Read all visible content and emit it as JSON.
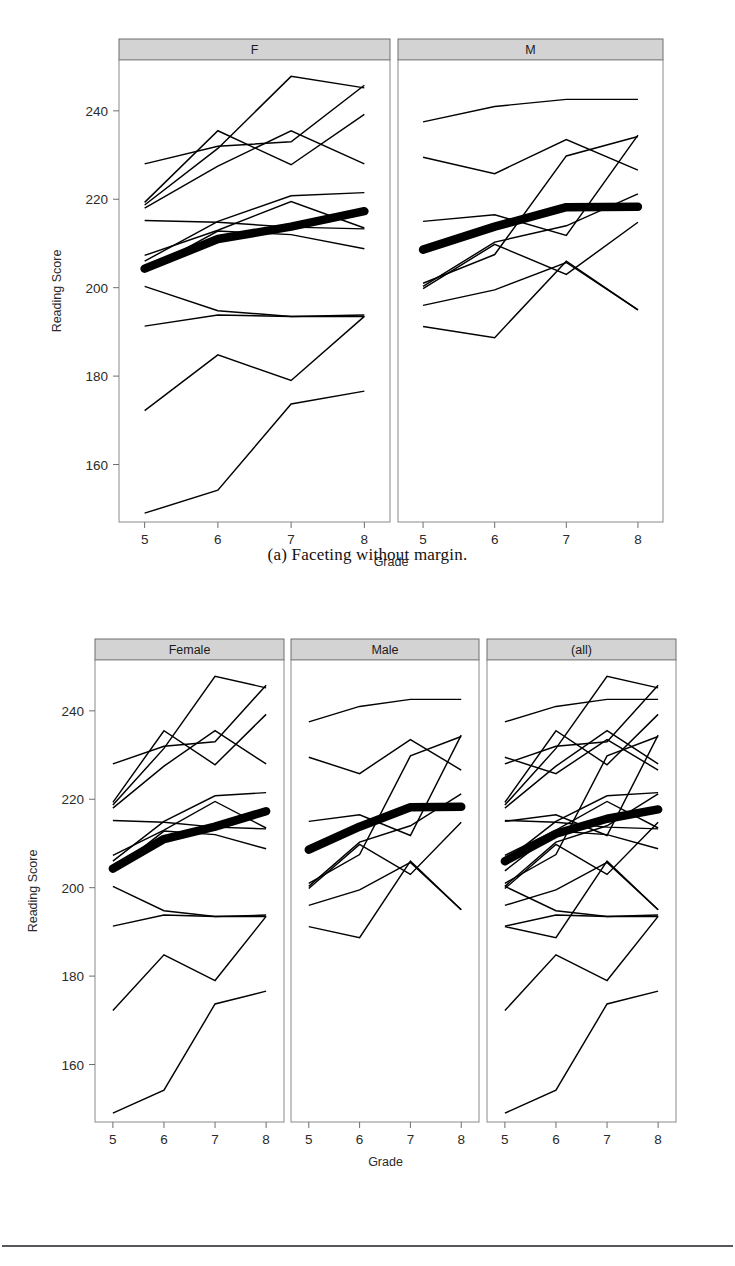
{
  "figure_a": {
    "caption": "(a) Faceting without margin.",
    "panels": [
      {
        "id": "panel-f",
        "label": "F"
      },
      {
        "id": "panel-m",
        "label": "M"
      }
    ]
  },
  "figure_b": {
    "caption": "(b) Faceting with margin.",
    "panels": [
      {
        "id": "panel-female",
        "label": "Female"
      },
      {
        "id": "panel-male",
        "label": "Male"
      },
      {
        "id": "panel-all",
        "label": "(all)"
      }
    ]
  },
  "chart_data": [
    {
      "id": "chart-a",
      "type": "line",
      "title": "",
      "xlabel": "Grade",
      "ylabel": "Reading Score",
      "x": [
        5,
        6,
        7,
        8
      ],
      "xticklabels": [
        "5",
        "6",
        "7",
        "8"
      ],
      "yticks": [
        160,
        180,
        200,
        220,
        240
      ],
      "yticklabels": [
        "160",
        "180",
        "200",
        "220",
        "240"
      ],
      "xlim": [
        4.65,
        8.35
      ],
      "ylim": [
        147.0,
        251.5
      ],
      "grid": false,
      "legend": "none",
      "facets": [
        {
          "label": "F",
          "series": [
            {
              "name": "F01",
              "values": [
                228.0,
                232.0,
                233.0,
                245.8
              ],
              "emphasis": false
            },
            {
              "name": "F02",
              "values": [
                218.7,
                231.5,
                247.8,
                245.2
              ],
              "emphasis": false
            },
            {
              "name": "F03",
              "values": [
                218.0,
                227.5,
                235.5,
                228.0
              ],
              "emphasis": false
            },
            {
              "name": "F04",
              "values": [
                219.3,
                235.5,
                227.8,
                239.2
              ],
              "emphasis": false
            },
            {
              "name": "F05",
              "values": [
                215.2,
                214.8,
                213.7,
                213.3
              ],
              "emphasis": false
            },
            {
              "name": "F06",
              "values": [
                206.0,
                215.0,
                220.8,
                221.5
              ],
              "emphasis": false
            },
            {
              "name": "F07",
              "values": [
                207.3,
                213.0,
                219.5,
                213.5
              ],
              "emphasis": false
            },
            {
              "name": "F08",
              "values": [
                203.8,
                212.8,
                212.0,
                208.8
              ],
              "emphasis": false
            },
            {
              "name": "F09",
              "values": [
                200.3,
                194.8,
                193.5,
                193.5
              ],
              "emphasis": false
            },
            {
              "name": "F10",
              "values": [
                191.3,
                193.8,
                193.5,
                193.8
              ],
              "emphasis": false
            },
            {
              "name": "F11",
              "values": [
                172.2,
                184.8,
                179.0,
                193.5
              ],
              "emphasis": false
            },
            {
              "name": "F12",
              "values": [
                149.0,
                154.2,
                173.7,
                176.6
              ],
              "emphasis": false
            },
            {
              "name": "F-mean",
              "values": [
                204.3,
                211.0,
                213.8,
                217.3
              ],
              "emphasis": true
            }
          ]
        },
        {
          "label": "M",
          "series": [
            {
              "name": "M01",
              "values": [
                237.5,
                241.0,
                242.6,
                242.6
              ],
              "emphasis": false
            },
            {
              "name": "M02",
              "values": [
                229.5,
                225.8,
                233.5,
                226.6
              ],
              "emphasis": false
            },
            {
              "name": "M03",
              "values": [
                215.0,
                216.5,
                211.8,
                234.5
              ],
              "emphasis": false
            },
            {
              "name": "M04",
              "values": [
                201.0,
                207.5,
                229.8,
                234.2
              ],
              "emphasis": false
            },
            {
              "name": "M05",
              "values": [
                200.3,
                210.3,
                214.0,
                221.2
              ],
              "emphasis": false
            },
            {
              "name": "M06",
              "values": [
                199.8,
                209.8,
                203.0,
                214.8
              ],
              "emphasis": false
            },
            {
              "name": "M07",
              "values": [
                196.0,
                199.5,
                205.7,
                195.0
              ],
              "emphasis": false
            },
            {
              "name": "M08",
              "values": [
                191.2,
                188.7,
                206.0,
                195.0
              ],
              "emphasis": false
            },
            {
              "name": "M-mean",
              "values": [
                208.6,
                213.8,
                218.2,
                218.3
              ],
              "emphasis": true
            }
          ]
        }
      ]
    },
    {
      "id": "chart-b",
      "type": "line",
      "title": "",
      "xlabel": "Grade",
      "ylabel": "Reading Score",
      "x": [
        5,
        6,
        7,
        8
      ],
      "xticklabels": [
        "5",
        "6",
        "7",
        "8"
      ],
      "yticks": [
        160,
        180,
        200,
        220,
        240
      ],
      "yticklabels": [
        "160",
        "180",
        "200",
        "220",
        "240"
      ],
      "xlim": [
        4.65,
        8.35
      ],
      "ylim": [
        147.0,
        251.5
      ],
      "grid": false,
      "legend": "none",
      "facets": [
        {
          "label": "Female",
          "series": [
            {
              "name": "F01",
              "values": [
                228.0,
                232.0,
                233.0,
                245.8
              ],
              "emphasis": false
            },
            {
              "name": "F02",
              "values": [
                218.7,
                231.5,
                247.8,
                245.2
              ],
              "emphasis": false
            },
            {
              "name": "F03",
              "values": [
                218.0,
                227.5,
                235.5,
                228.0
              ],
              "emphasis": false
            },
            {
              "name": "F04",
              "values": [
                219.3,
                235.5,
                227.8,
                239.2
              ],
              "emphasis": false
            },
            {
              "name": "F05",
              "values": [
                215.2,
                214.8,
                213.7,
                213.3
              ],
              "emphasis": false
            },
            {
              "name": "F06",
              "values": [
                206.0,
                215.0,
                220.8,
                221.5
              ],
              "emphasis": false
            },
            {
              "name": "F07",
              "values": [
                207.3,
                213.0,
                219.5,
                213.5
              ],
              "emphasis": false
            },
            {
              "name": "F08",
              "values": [
                203.8,
                212.8,
                212.0,
                208.8
              ],
              "emphasis": false
            },
            {
              "name": "F09",
              "values": [
                200.3,
                194.8,
                193.5,
                193.5
              ],
              "emphasis": false
            },
            {
              "name": "F10",
              "values": [
                191.3,
                193.8,
                193.5,
                193.8
              ],
              "emphasis": false
            },
            {
              "name": "F11",
              "values": [
                172.2,
                184.8,
                179.0,
                193.5
              ],
              "emphasis": false
            },
            {
              "name": "F12",
              "values": [
                149.0,
                154.2,
                173.7,
                176.6
              ],
              "emphasis": false
            },
            {
              "name": "F-mean",
              "values": [
                204.3,
                211.0,
                213.8,
                217.3
              ],
              "emphasis": true
            }
          ]
        },
        {
          "label": "Male",
          "series": [
            {
              "name": "M01",
              "values": [
                237.5,
                241.0,
                242.6,
                242.6
              ],
              "emphasis": false
            },
            {
              "name": "M02",
              "values": [
                229.5,
                225.8,
                233.5,
                226.6
              ],
              "emphasis": false
            },
            {
              "name": "M03",
              "values": [
                215.0,
                216.5,
                211.8,
                234.5
              ],
              "emphasis": false
            },
            {
              "name": "M04",
              "values": [
                201.0,
                207.5,
                229.8,
                234.2
              ],
              "emphasis": false
            },
            {
              "name": "M05",
              "values": [
                200.3,
                210.3,
                214.0,
                221.2
              ],
              "emphasis": false
            },
            {
              "name": "M06",
              "values": [
                199.8,
                209.8,
                203.0,
                214.8
              ],
              "emphasis": false
            },
            {
              "name": "M07",
              "values": [
                196.0,
                199.5,
                205.7,
                195.0
              ],
              "emphasis": false
            },
            {
              "name": "M08",
              "values": [
                191.2,
                188.7,
                206.0,
                195.0
              ],
              "emphasis": false
            },
            {
              "name": "M-mean",
              "values": [
                208.6,
                213.8,
                218.2,
                218.3
              ],
              "emphasis": true
            }
          ]
        },
        {
          "label": "(all)",
          "series": [
            {
              "name": "F01",
              "values": [
                228.0,
                232.0,
                233.0,
                245.8
              ],
              "emphasis": false
            },
            {
              "name": "F02",
              "values": [
                218.7,
                231.5,
                247.8,
                245.2
              ],
              "emphasis": false
            },
            {
              "name": "F03",
              "values": [
                218.0,
                227.5,
                235.5,
                228.0
              ],
              "emphasis": false
            },
            {
              "name": "F04",
              "values": [
                219.3,
                235.5,
                227.8,
                239.2
              ],
              "emphasis": false
            },
            {
              "name": "F05",
              "values": [
                215.2,
                214.8,
                213.7,
                213.3
              ],
              "emphasis": false
            },
            {
              "name": "F06",
              "values": [
                206.0,
                215.0,
                220.8,
                221.5
              ],
              "emphasis": false
            },
            {
              "name": "F07",
              "values": [
                207.3,
                213.0,
                219.5,
                213.5
              ],
              "emphasis": false
            },
            {
              "name": "F08",
              "values": [
                203.8,
                212.8,
                212.0,
                208.8
              ],
              "emphasis": false
            },
            {
              "name": "F09",
              "values": [
                200.3,
                194.8,
                193.5,
                193.5
              ],
              "emphasis": false
            },
            {
              "name": "F10",
              "values": [
                191.3,
                193.8,
                193.5,
                193.8
              ],
              "emphasis": false
            },
            {
              "name": "F11",
              "values": [
                172.2,
                184.8,
                179.0,
                193.5
              ],
              "emphasis": false
            },
            {
              "name": "F12",
              "values": [
                149.0,
                154.2,
                173.7,
                176.6
              ],
              "emphasis": false
            },
            {
              "name": "M01",
              "values": [
                237.5,
                241.0,
                242.6,
                242.6
              ],
              "emphasis": false
            },
            {
              "name": "M02",
              "values": [
                229.5,
                225.8,
                233.5,
                226.6
              ],
              "emphasis": false
            },
            {
              "name": "M03",
              "values": [
                215.0,
                216.5,
                211.8,
                234.5
              ],
              "emphasis": false
            },
            {
              "name": "M04",
              "values": [
                201.0,
                207.5,
                229.8,
                234.2
              ],
              "emphasis": false
            },
            {
              "name": "M05",
              "values": [
                200.3,
                210.3,
                214.0,
                221.2
              ],
              "emphasis": false
            },
            {
              "name": "M06",
              "values": [
                199.8,
                209.8,
                203.0,
                214.8
              ],
              "emphasis": false
            },
            {
              "name": "M07",
              "values": [
                196.0,
                199.5,
                205.7,
                195.0
              ],
              "emphasis": false
            },
            {
              "name": "M08",
              "values": [
                191.2,
                188.7,
                206.0,
                195.0
              ],
              "emphasis": false
            },
            {
              "name": "ALL-mean",
              "values": [
                206.0,
                212.2,
                215.6,
                217.7
              ],
              "emphasis": true
            }
          ]
        }
      ]
    }
  ],
  "colors": {
    "strip_fill": "#d3d3d3",
    "strip_stroke": "#6e6e6e",
    "panel_stroke": "#8a8a8a",
    "line": "#000000",
    "text": "#2b2b2b",
    "rule": "#58585c"
  },
  "layout": {
    "chart_a": {
      "panel_top": 60,
      "panel_bottom": 522,
      "strip_height": 21,
      "strip_top": 39,
      "panels_x": [
        [
          119,
          390
        ],
        [
          398,
          663
        ]
      ],
      "gap": 8
    },
    "chart_b": {
      "panel_top": 660,
      "panel_bottom": 1122,
      "strip_height": 21,
      "strip_top": 639,
      "panels_x": [
        [
          95,
          284
        ],
        [
          291,
          479
        ],
        [
          487,
          676
        ]
      ],
      "gap": 7
    }
  }
}
